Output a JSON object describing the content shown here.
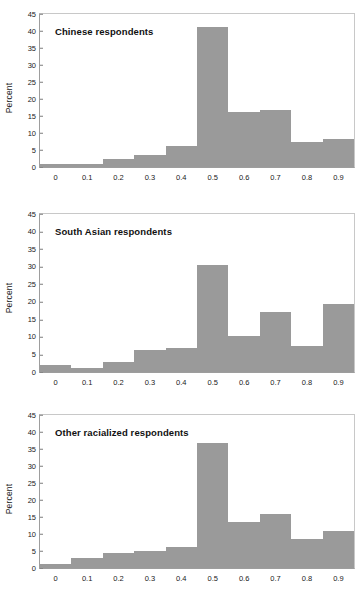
{
  "figure": {
    "ylabel": "Percent",
    "xticklabels": [
      "0",
      "0.1",
      "0.2",
      "0.3",
      "0.4",
      "0.5",
      "0.6",
      "0.7",
      "0.8",
      "0.9"
    ],
    "yticklabels": [
      "0",
      "5",
      "10",
      "15",
      "20",
      "25",
      "30",
      "35",
      "40",
      "45"
    ],
    "bar_color": "#9a9a9a",
    "axis_color": "#9d9d9d"
  },
  "chart_data": [
    {
      "type": "bar",
      "title": "Chinese respondents",
      "xlabel": "",
      "ylabel": "Percent",
      "ylim": [
        0,
        45
      ],
      "xlim": [
        -0.05,
        0.95
      ],
      "grid": false,
      "legend": "none",
      "categories": [
        "0",
        "0.1",
        "0.2",
        "0.3",
        "0.4",
        "0.5",
        "0.6",
        "0.7",
        "0.8",
        "0.9"
      ],
      "values": [
        1.0,
        1.0,
        2.5,
        3.6,
        6.2,
        41.3,
        16.3,
        16.8,
        7.5,
        8.3
      ]
    },
    {
      "type": "bar",
      "title": "South Asian respondents",
      "xlabel": "",
      "ylabel": "Percent",
      "ylim": [
        0,
        45
      ],
      "xlim": [
        -0.05,
        0.95
      ],
      "grid": false,
      "legend": "none",
      "categories": [
        "0",
        "0.1",
        "0.2",
        "0.3",
        "0.4",
        "0.5",
        "0.6",
        "0.7",
        "0.8",
        "0.9"
      ],
      "values": [
        1.9,
        1.2,
        2.9,
        6.4,
        6.8,
        30.6,
        10.2,
        17.0,
        7.4,
        19.5
      ]
    },
    {
      "type": "bar",
      "title": "Other racialized respondents",
      "xlabel": "",
      "ylabel": "Percent",
      "ylim": [
        0,
        45
      ],
      "grid": false,
      "legend": "none",
      "xlim": [
        -0.05,
        0.95
      ],
      "categories": [
        "0",
        "0.1",
        "0.2",
        "0.3",
        "0.4",
        "0.5",
        "0.6",
        "0.7",
        "0.8",
        "0.9"
      ],
      "values": [
        1.2,
        2.8,
        4.5,
        5.0,
        6.1,
        36.7,
        13.4,
        16.0,
        8.6,
        11.0
      ]
    }
  ]
}
